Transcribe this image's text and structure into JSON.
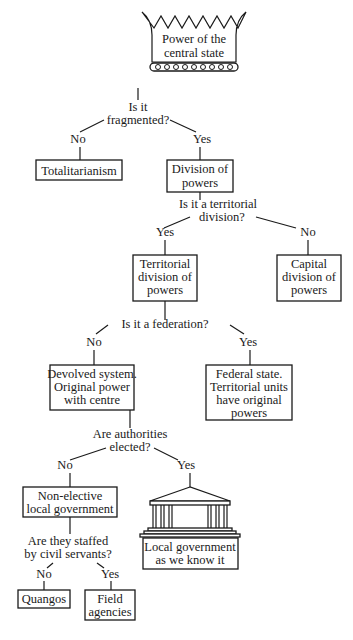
{
  "diagram": {
    "title_node": {
      "lines": [
        "Power of the",
        "central state"
      ],
      "icon": "crown-icon"
    },
    "questions": {
      "fragmented": [
        "Is it",
        "fragmented?"
      ],
      "territorial": [
        "Is it a territorial",
        "division?"
      ],
      "federation": [
        "Is it a federation?"
      ],
      "elected": [
        "Are authorities",
        "elected?"
      ],
      "civil_servants": [
        "Are they staffed",
        "by civil servants?"
      ]
    },
    "answers": {
      "yes": "Yes",
      "no": "No"
    },
    "nodes": {
      "totalitarianism": [
        "Totalitarianism"
      ],
      "division": [
        "Division of",
        "powers"
      ],
      "territorial": [
        "Territorial",
        "division of",
        "powers"
      ],
      "capital": [
        "Capital",
        "division of",
        "powers"
      ],
      "devolved": [
        "Devolved system.",
        "Original power",
        "with centre"
      ],
      "federal": [
        "Federal state.",
        "Territorial units",
        "have original",
        "powers"
      ],
      "non_elective": [
        "Non-elective",
        "local government"
      ],
      "local_gov": [
        "Local government",
        "as we know it"
      ],
      "quangos": [
        "Quangos"
      ],
      "field": [
        "Field",
        "agencies"
      ]
    },
    "colors": {
      "ink": "#1a1a1a",
      "background": "#ffffff"
    }
  }
}
